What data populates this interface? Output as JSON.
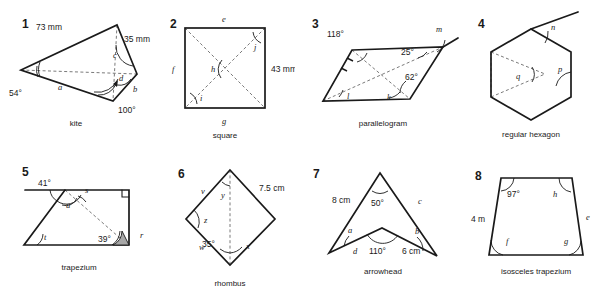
{
  "worksheet": {
    "title": "Geometry shapes angle worksheet",
    "figures": [
      {
        "number": "1",
        "caption": "kite",
        "shape_type": "kite",
        "dimensions": [
          "73 mm",
          "35 mm"
        ],
        "angles": [
          "54°",
          "100°"
        ],
        "unknowns": [
          "a",
          "b",
          "c",
          "d"
        ]
      },
      {
        "number": "2",
        "caption": "square",
        "shape_type": "square",
        "dimensions": [
          "43 mm"
        ],
        "angles": [],
        "unknowns": [
          "e",
          "f",
          "g",
          "h",
          "i",
          "j"
        ]
      },
      {
        "number": "3",
        "caption": "parallelogram",
        "shape_type": "parallelogram",
        "dimensions": [],
        "angles": [
          "118°",
          "25°",
          "62°"
        ],
        "unknowns": [
          "k",
          "l",
          "m"
        ]
      },
      {
        "number": "4",
        "caption": "regular hexagon",
        "shape_type": "regular-hexagon",
        "dimensions": [],
        "angles": [],
        "unknowns": [
          "n",
          "p",
          "q"
        ]
      },
      {
        "number": "5",
        "caption": "trapezium",
        "shape_type": "trapezium",
        "dimensions": [],
        "angles": [
          "41°",
          "39°"
        ],
        "unknowns": [
          "r",
          "s",
          "t",
          "u"
        ]
      },
      {
        "number": "6",
        "caption": "rhombus",
        "shape_type": "rhombus",
        "dimensions": [
          "7.5 cm"
        ],
        "angles": [
          "35°"
        ],
        "unknowns": [
          "v",
          "w",
          "x",
          "y",
          "z"
        ]
      },
      {
        "number": "7",
        "caption": "arrowhead",
        "shape_type": "arrowhead",
        "dimensions": [
          "8 cm",
          "6 cm"
        ],
        "angles": [
          "50°",
          "110°"
        ],
        "unknowns": [
          "a",
          "b",
          "c",
          "d"
        ]
      },
      {
        "number": "8",
        "caption": "isosceles trapezium",
        "shape_type": "isosceles-trapezium",
        "dimensions": [
          "4 m"
        ],
        "angles": [
          "97°"
        ],
        "unknowns": [
          "e",
          "f",
          "g",
          "h"
        ]
      }
    ]
  },
  "fig1": {
    "num": "1",
    "caption": "kite",
    "len_73": "73 mm",
    "len_35": "35 mm",
    "ang_54": "54°",
    "ang_100": "100°",
    "a": "a",
    "b": "b",
    "c": "c",
    "d": "d"
  },
  "fig2": {
    "num": "2",
    "caption": "square",
    "len_43": "43 mm",
    "e": "e",
    "f": "f",
    "g": "g",
    "h": "h",
    "i": "i",
    "j": "j"
  },
  "fig3": {
    "num": "3",
    "caption": "parallelogram",
    "ang_118": "118°",
    "ang_25": "25°",
    "ang_62": "62°",
    "k": "k",
    "l": "l",
    "m": "m"
  },
  "fig4": {
    "num": "4",
    "caption": "regular hexagon",
    "n": "n",
    "p": "p",
    "q": "q"
  },
  "fig5": {
    "num": "5",
    "caption": "trapezium",
    "ang_41": "41°",
    "ang_39": "39°",
    "r": "r",
    "s": "s",
    "t": "t",
    "u": "u"
  },
  "fig6": {
    "num": "6",
    "caption": "rhombus",
    "len_75": "7.5 cm",
    "ang_35": "35°",
    "v": "v",
    "w": "w",
    "x": "x",
    "y": "y",
    "z": "z"
  },
  "fig7": {
    "num": "7",
    "caption": "arrowhead",
    "len_8": "8 cm",
    "len_6": "6 cm",
    "ang_50": "50°",
    "ang_110": "110°",
    "a": "a",
    "b": "b",
    "c": "c",
    "d": "d"
  },
  "fig8": {
    "num": "8",
    "caption": "isosceles trapezium",
    "len_4": "4 m",
    "ang_97": "97°",
    "e": "e",
    "f": "f",
    "g": "g",
    "h": "h"
  },
  "colors": {
    "stroke": "#1a1a1a",
    "dashed": "#6b6b6b",
    "shade": "#a8a8a8",
    "background": "#ffffff"
  }
}
